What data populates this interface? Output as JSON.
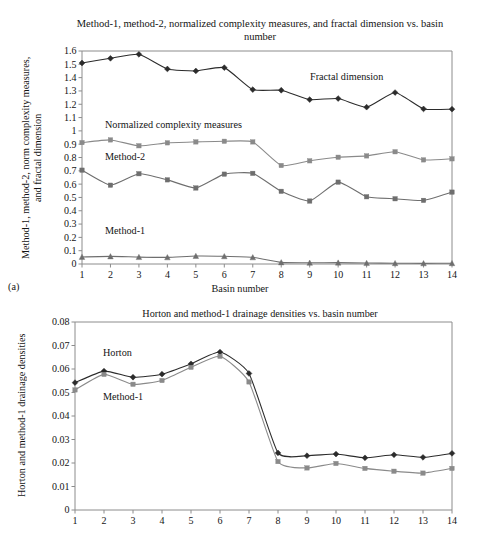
{
  "figure_a": {
    "panel_label": "(a)",
    "title": "Method-1, method-2, normalized complexity measures, and fractal dimension vs. basin number",
    "ylabel": "Method-1, method-2, norm complexity measures, and fractal dimension",
    "xlabel": "Basin number",
    "annotations": {
      "fractal": "Fractal dimension",
      "normalized": "Normalized complexity measures",
      "method2": "Method-2",
      "method1": "Method-1"
    }
  },
  "figure_b": {
    "title": "Horton and method-1 drainage densities vs. basin number",
    "ylabel": "Horton and method-1 drainage densities",
    "annotations": {
      "horton": "Horton",
      "method1": "Method-1"
    }
  },
  "chart_data": [
    {
      "type": "line",
      "title": "Method-1, method-2, normalized complexity measures, and fractal dimension vs. basin number",
      "xlabel": "Basin number",
      "ylabel": "Method-1, method-2, norm complexity measures, and fractal dimension",
      "categories": [
        1,
        2,
        3,
        4,
        5,
        6,
        7,
        8,
        9,
        10,
        11,
        12,
        13,
        14
      ],
      "x": [
        1,
        2,
        3,
        4,
        5,
        6,
        7,
        8,
        9,
        10,
        11,
        12,
        13,
        14
      ],
      "xlim": [
        1,
        14
      ],
      "ylim": [
        0,
        1.6
      ],
      "ytick_labels": [
        "0",
        "0.1",
        "0.2",
        "0.3",
        "0.4",
        "0.5",
        "0.6",
        "0.7",
        "0.8",
        "0.9",
        "1",
        "1.1",
        "1.2",
        "1.3",
        "1.4",
        "1.5",
        "1.6"
      ],
      "xtick_labels": [
        "1",
        "2",
        "3",
        "4",
        "5",
        "6",
        "7",
        "8",
        "9",
        "10",
        "11",
        "12",
        "13",
        "14"
      ],
      "grid": false,
      "legend": "inline-annotations",
      "series": [
        {
          "name": "Fractal dimension",
          "marker": "diamond",
          "color": "#2b2b2b",
          "values": [
            1.51,
            1.545,
            1.575,
            1.465,
            1.45,
            1.475,
            1.31,
            1.305,
            1.235,
            1.243,
            1.178,
            1.288,
            1.165,
            1.163
          ]
        },
        {
          "name": "Normalized complexity measures",
          "marker": "square",
          "color": "#8a8a8a",
          "values": [
            0.912,
            0.932,
            0.888,
            0.91,
            0.917,
            0.922,
            0.917,
            0.74,
            0.775,
            0.802,
            0.812,
            0.843,
            0.782,
            0.79
          ]
        },
        {
          "name": "Method-2",
          "marker": "square",
          "color": "#6e6e6e",
          "values": [
            0.705,
            0.592,
            0.678,
            0.632,
            0.571,
            0.675,
            0.681,
            0.546,
            0.473,
            0.615,
            0.505,
            0.49,
            0.478,
            0.54
          ]
        },
        {
          "name": "Method-1",
          "marker": "triangle",
          "color": "#6e6e6e",
          "values": [
            0.053,
            0.057,
            0.052,
            0.05,
            0.06,
            0.058,
            0.05,
            0.012,
            0.009,
            0.01,
            0.007,
            0.006,
            0.005,
            0.006
          ]
        }
      ]
    },
    {
      "type": "line",
      "title": "Horton and method-1 drainage densities vs. basin number",
      "xlabel": "",
      "ylabel": "Horton and method-1 drainage densities",
      "categories": [
        1,
        2,
        3,
        4,
        5,
        6,
        7,
        8,
        9,
        10,
        11,
        12,
        13,
        14
      ],
      "x": [
        1,
        2,
        3,
        4,
        5,
        6,
        7,
        8,
        9,
        10,
        11,
        12,
        13,
        14
      ],
      "xlim": [
        1,
        14
      ],
      "ylim": [
        0,
        0.08
      ],
      "ytick_labels": [
        "0",
        "0.01",
        "0.02",
        "0.03",
        "0.04",
        "0.05",
        "0.06",
        "0.07",
        "0.08"
      ],
      "xtick_labels": [
        "1",
        "2",
        "3",
        "4",
        "5",
        "6",
        "7",
        "8",
        "9",
        "10",
        "11",
        "12",
        "13",
        "14"
      ],
      "grid": false,
      "legend": "inline-annotations",
      "series": [
        {
          "name": "Horton",
          "marker": "diamond",
          "color": "#2b2b2b",
          "values": [
            0.0542,
            0.0591,
            0.0565,
            0.0578,
            0.0622,
            0.0672,
            0.0581,
            0.0243,
            0.0231,
            0.0238,
            0.0222,
            0.0235,
            0.0224,
            0.0241
          ]
        },
        {
          "name": "Method-1",
          "marker": "square",
          "color": "#8a8a8a",
          "values": [
            0.0511,
            0.0577,
            0.0535,
            0.0551,
            0.0607,
            0.0654,
            0.0545,
            0.0206,
            0.0179,
            0.0198,
            0.0177,
            0.0165,
            0.0157,
            0.0177
          ]
        }
      ]
    }
  ]
}
